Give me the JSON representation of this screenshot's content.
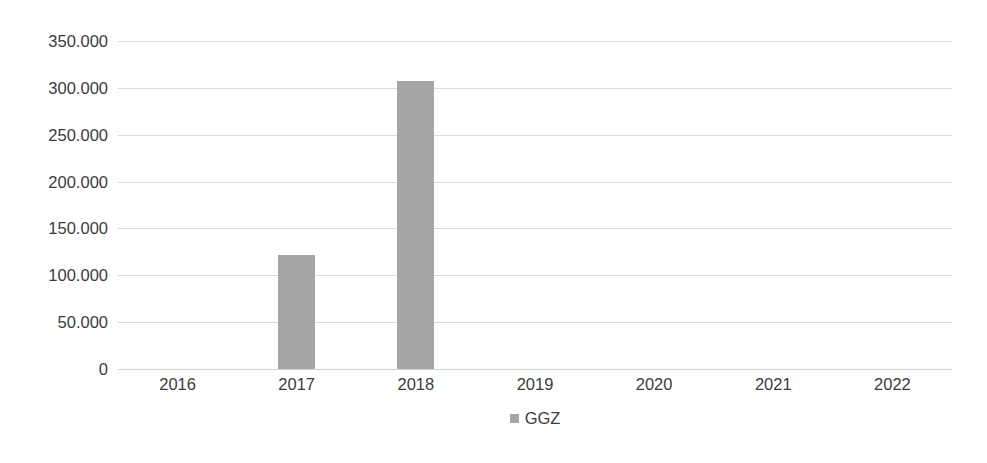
{
  "chart_data": {
    "type": "bar",
    "title": "",
    "subtitle": "",
    "xlabel": "",
    "ylabel": "",
    "categories": [
      "2016",
      "2017",
      "2018",
      "2019",
      "2020",
      "2021",
      "2022"
    ],
    "series": [
      {
        "name": "GGZ",
        "color": "#A6A6A6",
        "values": [
          0,
          122000,
          307000,
          0,
          0,
          0,
          0
        ]
      }
    ],
    "ylim": [
      0,
      350000
    ],
    "ytick_step": 50000,
    "ytick_labels": [
      "0",
      "50.000",
      "100.000",
      "150.000",
      "200.000",
      "250.000",
      "300.000",
      "350.000"
    ],
    "ytick_values": [
      0,
      50000,
      100000,
      150000,
      200000,
      250000,
      300000,
      350000
    ],
    "grid": "horizontal",
    "legend_position": "bottom",
    "legend_entries": [
      {
        "label": "GGZ",
        "color": "#A6A6A6",
        "marker": "square-swatch"
      }
    ],
    "annotations": [],
    "number_format": "european-dot-thousands"
  },
  "colors": {
    "background": "#FFFFFF",
    "bar": "#A6A6A6",
    "gridline": "#D9D9D9",
    "baseline": "#D0D0D0",
    "text": "#3B3B3B"
  }
}
